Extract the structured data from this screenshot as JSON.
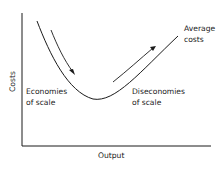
{
  "diagram": {
    "type": "cost-curve",
    "axes": {
      "y_label": "Costs",
      "x_label": "Output"
    },
    "curve_label": {
      "line1": "Average",
      "line2": "costs"
    },
    "regions": {
      "left": {
        "line1": "Economies",
        "line2": "of scale",
        "arrow_direction": "down"
      },
      "right": {
        "line1": "Diseconomies",
        "line2": "of scale",
        "arrow_direction": "up"
      }
    },
    "colors": {
      "line": "#1a1a1a",
      "background": "#ffffff"
    }
  }
}
